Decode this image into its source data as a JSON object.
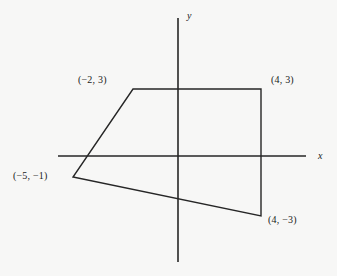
{
  "figure": {
    "kind": "coordinate-plane-polygon",
    "background_color": "#f7f7f6",
    "ink_color": "#262626"
  },
  "axes": {
    "x_label": "x",
    "y_label": "y",
    "x_axis": {
      "x1": 58,
      "y1": 156,
      "x2": 306,
      "y2": 156
    },
    "y_axis": {
      "x1": 178,
      "y1": 18,
      "x2": 178,
      "y2": 262
    },
    "origin": {
      "x": 178,
      "y": 156
    },
    "unit_px": 21
  },
  "chart_data": {
    "type": "scatter",
    "title": "",
    "xlabel": "x",
    "ylabel": "y",
    "grid": false,
    "legend": null,
    "xlim": [
      -5.7,
      6.1
    ],
    "ylim": [
      -5.0,
      6.6
    ],
    "shape": "quadrilateral",
    "closed": true,
    "vertices": [
      {
        "label": "(−2, 3)",
        "x": -2,
        "y": 3,
        "px": 133,
        "py": 89
      },
      {
        "label": "(4, 3)",
        "x": 4,
        "y": 3,
        "px": 261,
        "py": 89
      },
      {
        "label": "(4, −3)",
        "x": 4,
        "y": -3,
        "px": 261,
        "py": 216
      },
      {
        "label": "(−5, −1)",
        "x": -5,
        "y": -1,
        "px": 73,
        "py": 177
      }
    ]
  }
}
